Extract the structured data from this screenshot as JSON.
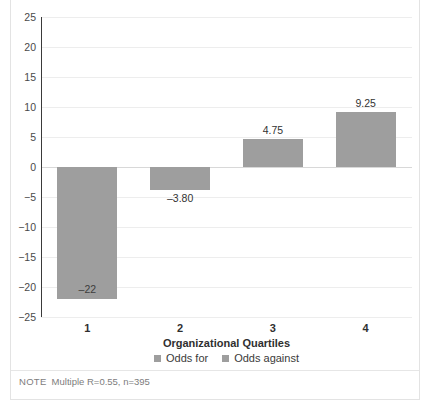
{
  "chart_data": {
    "type": "bar",
    "title": "",
    "xlabel": "Organizational Quartiles",
    "ylabel": "",
    "categories": [
      "1",
      "2",
      "3",
      "4"
    ],
    "values": [
      -22,
      -3.8,
      4.75,
      9.25
    ],
    "data_labels": [
      "–22",
      "–3.80",
      "4.75",
      "9.25"
    ],
    "ylim": [
      -25,
      25
    ],
    "yticks": [
      "25",
      "20",
      "15",
      "10",
      "5",
      "0",
      "−5",
      "−10",
      "−15",
      "−20",
      "−25"
    ],
    "ytick_values": [
      25,
      20,
      15,
      10,
      5,
      0,
      -5,
      -10,
      -15,
      -20,
      -25
    ],
    "grid": true,
    "legend": {
      "position": "bottom",
      "entries": [
        {
          "label": "Odds for",
          "color": "#9e9e9e"
        },
        {
          "label": "Odds against",
          "color": "#9e9e9e"
        }
      ]
    },
    "bar_color": "#9e9e9e"
  },
  "figure": {
    "title_clipped": "",
    "note_label": "NOTE",
    "note_text": "Multiple R=0.55, n=395"
  }
}
